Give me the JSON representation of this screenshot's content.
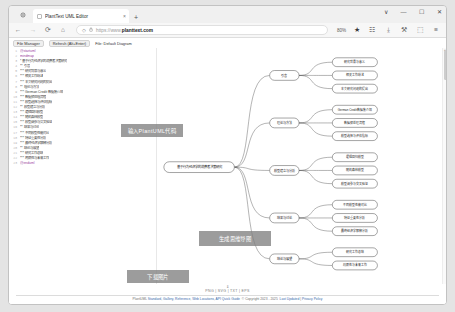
{
  "window": {
    "tab_title": "PlantText UML Editor",
    "tab_close": "×",
    "new_tab": "+",
    "controls": {
      "list": "∨",
      "minimize": "—",
      "maximize": "☐",
      "close": "✕"
    }
  },
  "nav": {
    "back": "←",
    "forward": "→",
    "reload": "⟳",
    "home": "⌂",
    "shield": "◇",
    "lock": "🔒",
    "url_prefix": "https://www.",
    "url_domain": "planttext.com",
    "zoom_level": "80%",
    "bookmark_star": "★",
    "container": "☷",
    "downloads": "⤓",
    "account": "⚒",
    "save": "⬚",
    "menu": "≡"
  },
  "app_toolbar": {
    "file_manager": "File Manager",
    "refresh": "Refresh (Alt+Enter)",
    "file_label": "File: Default Diagram"
  },
  "editor": {
    "lines": [
      {
        "n": "1",
        "t": "@startuml",
        "cls": "kw"
      },
      {
        "n": "2",
        "t": "mindmap",
        "cls": "kw"
      },
      {
        "n": "3",
        "t": "* 基于行为经济学的消费者决策研究",
        "cls": ""
      },
      {
        "n": "4",
        "t": "** 引言",
        "cls": ""
      },
      {
        "n": "5",
        "t": "*** 研究背景与意义",
        "cls": ""
      },
      {
        "n": "6",
        "t": "*** 相关工作综述",
        "cls": ""
      },
      {
        "n": "7",
        "t": "*** 本文研究问题的提出",
        "cls": ""
      },
      {
        "n": "8",
        "t": "** 理论与方法",
        "cls": ""
      },
      {
        "n": "9",
        "t": "*** German Credit 数据集介绍",
        "cls": ""
      },
      {
        "n": "10",
        "t": "*** 数据预处理流程",
        "cls": ""
      },
      {
        "n": "11",
        "t": "*** 模型选择与评估指标",
        "cls": ""
      },
      {
        "n": "12",
        "t": "** 模型建立与分析",
        "cls": ""
      },
      {
        "n": "13",
        "t": "*** 逻辑回归模型",
        "cls": ""
      },
      {
        "n": "14",
        "t": "*** 随机森林模型",
        "cls": ""
      },
      {
        "n": "15",
        "t": "*** 模型调参与交叉验证",
        "cls": ""
      },
      {
        "n": "16",
        "t": "** 结果与讨论",
        "cls": ""
      },
      {
        "n": "17",
        "t": "*** 不同模型性能对比",
        "cls": ""
      },
      {
        "n": "18",
        "t": "*** 特征重要性分析",
        "cls": ""
      },
      {
        "n": "19",
        "t": "*** 最终经济学解释分析",
        "cls": ""
      },
      {
        "n": "20",
        "t": "** 结论与展望",
        "cls": ""
      },
      {
        "n": "21",
        "t": "*** 研究工作总结",
        "cls": ""
      },
      {
        "n": "22",
        "t": "*** 局限性与未来工作",
        "cls": ""
      },
      {
        "n": "23",
        "t": "@enduml",
        "cls": "kw"
      }
    ]
  },
  "annotations": {
    "input_code": "输入PlantUML代码",
    "generate_map": "生成思维导图",
    "download_image": "下载图片"
  },
  "mindmap": {
    "root": "基于行为经济学的消费者决策研究",
    "branches": [
      {
        "label": "引言",
        "children": [
          "研究背景与意义",
          "相关工作综述",
          "本文研究问题的提出"
        ]
      },
      {
        "label": "理论与方法",
        "children": [
          "German Credit数据集介绍",
          "数据预处理流程",
          "模型选择与评估指标"
        ]
      },
      {
        "label": "模型建立与分析",
        "children": [
          "逻辑回归模型",
          "随机森林模型",
          "模型调参与交叉验证"
        ]
      },
      {
        "label": "结果与讨论",
        "children": [
          "不同模型性能对比",
          "特征重要性分析",
          "最终经济学解释分析"
        ]
      },
      {
        "label": "结论与展望",
        "children": [
          "研究工作总结",
          "局限性与未来工作"
        ]
      }
    ]
  },
  "footer": {
    "arrow": "⇓",
    "coords": "PNG  |  SVG  |  TXT  |  EPS",
    "links_prefix": "PlantUML ",
    "links": [
      "Standard",
      "Gallery",
      "Reference",
      "Web Locations",
      "API Quick Guide"
    ],
    "copyright": "© Copyright 2023 - 2025",
    "last_update": "Last Updated",
    "privacy": "Privacy Policy"
  }
}
